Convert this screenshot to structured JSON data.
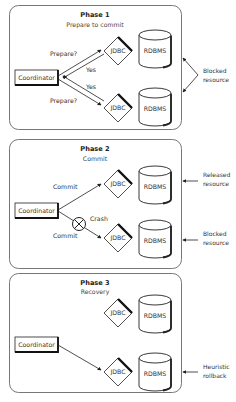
{
  "phases": [
    {
      "title": "Phase 1",
      "subtitle": "Prepare to commit",
      "coordinator": "Coordinator",
      "jdbc_top": "JDBC",
      "jdbc_bottom": "JDBC",
      "db_top": "RDBMS",
      "db_bottom": "RDBMS",
      "msg_top": "Prepare?",
      "msg_bottom": "Prepare?",
      "reply_top": "Yes",
      "reply_bottom": "Yes",
      "side_note": [
        "Blocked",
        "resource"
      ]
    },
    {
      "title": "Phase 2",
      "subtitle": "Commit",
      "coordinator": "Coordinator",
      "jdbc_top": "JDBC",
      "jdbc_bottom": "JDBC",
      "db_top": "RDBMS",
      "db_bottom": "RDBMS",
      "msg_top": "Commit",
      "msg_bottom": "Commit",
      "crash_label": "Crash",
      "side_note_top": [
        "Released",
        "resource"
      ],
      "side_note_bottom": [
        "Blocked",
        "resource"
      ]
    },
    {
      "title": "Phase 3",
      "subtitle": "Recovery",
      "coordinator": "Coordinator",
      "jdbc_top": "JDBC",
      "jdbc_bottom": "JDBC",
      "db_top": "RDBMS",
      "db_bottom": "RDBMS",
      "side_note_bottom": [
        "Heuristic",
        "rollback"
      ]
    }
  ],
  "colors": {
    "frame": "#777777",
    "line": "#222222",
    "text": "#333333"
  }
}
